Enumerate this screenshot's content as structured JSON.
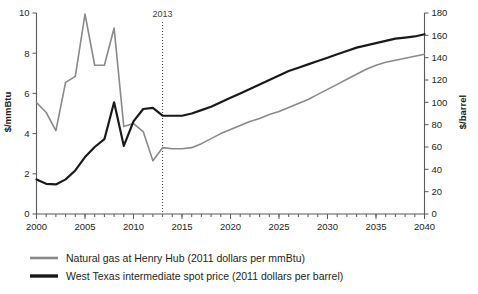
{
  "chart_data": {
    "type": "line",
    "title": "",
    "xlabel": "",
    "ylabel": "$/mmBtu",
    "y2label": "$/barrel",
    "xlim": [
      2000,
      2040
    ],
    "ylim": [
      0,
      10
    ],
    "y2lim": [
      0,
      180
    ],
    "xticks": [
      2000,
      2005,
      2010,
      2015,
      2020,
      2025,
      2030,
      2035,
      2040
    ],
    "xtick_labels": [
      "2000",
      "2005",
      "2010",
      "2015",
      "2020",
      "2025",
      "2030",
      "2035",
      "2040"
    ],
    "xminor_step": 1,
    "yticks": [
      0,
      2,
      4,
      6,
      8,
      10
    ],
    "ytick_labels": [
      "0",
      "2",
      "4",
      "6",
      "8",
      "10"
    ],
    "y2ticks": [
      0,
      20,
      40,
      60,
      80,
      100,
      120,
      140,
      160,
      180
    ],
    "y2tick_labels": [
      "0",
      "20",
      "40",
      "60",
      "80",
      "100",
      "120",
      "140",
      "160",
      "180"
    ],
    "grid": false,
    "legend_position": "below",
    "annotations": [
      {
        "name": "history-projection-divider",
        "label": "2013",
        "x": 2013,
        "style": "dotted-vertical"
      }
    ],
    "x": [
      2000,
      2001,
      2002,
      2003,
      2004,
      2005,
      2006,
      2007,
      2008,
      2009,
      2010,
      2011,
      2012,
      2013,
      2014,
      2015,
      2016,
      2017,
      2018,
      2019,
      2020,
      2021,
      2022,
      2023,
      2024,
      2025,
      2026,
      2027,
      2028,
      2029,
      2030,
      2031,
      2032,
      2033,
      2034,
      2035,
      2036,
      2037,
      2038,
      2039,
      2040
    ],
    "series": [
      {
        "name": "Natural gas at Henry Hub (2011 dollars per mmBtu)",
        "short_name": "natural-gas-henry-hub",
        "axis": "left",
        "units": "2011 dollars per mmBtu",
        "color": "#8a8a8a",
        "line_width": 1.6,
        "values": [
          5.55,
          5.05,
          4.15,
          6.55,
          6.85,
          9.95,
          7.4,
          7.4,
          9.25,
          4.35,
          4.5,
          4.1,
          2.65,
          3.3,
          3.25,
          3.25,
          3.3,
          3.5,
          3.75,
          4.0,
          4.2,
          4.4,
          4.6,
          4.75,
          4.95,
          5.1,
          5.3,
          5.5,
          5.7,
          5.95,
          6.2,
          6.45,
          6.7,
          6.95,
          7.2,
          7.4,
          7.55,
          7.65,
          7.75,
          7.85,
          7.95
        ]
      },
      {
        "name": "West Texas intermediate spot price (2011 dollars per barrel)",
        "short_name": "wti-spot-price",
        "axis": "right",
        "units": "2011 dollars per barrel",
        "color": "#1a1a1a",
        "line_width": 2.2,
        "values": [
          31,
          27,
          26.5,
          31,
          39,
          51,
          60,
          67,
          100,
          61,
          83,
          94,
          95,
          88,
          88,
          88,
          90,
          93,
          96,
          100,
          104,
          108,
          112,
          116,
          120,
          124,
          128,
          131,
          134,
          137,
          140,
          143,
          146,
          149,
          151,
          153,
          155,
          157,
          158,
          159,
          161
        ]
      }
    ]
  },
  "legend": {
    "items": [
      {
        "label": "Natural gas at Henry Hub (2011 dollars per mmBtu)",
        "color": "#8a8a8a",
        "line_width": 2.6
      },
      {
        "label": "West Texas intermediate spot price (2011 dollars per barrel)",
        "color": "#1a1a1a",
        "line_width": 3.4
      }
    ]
  }
}
